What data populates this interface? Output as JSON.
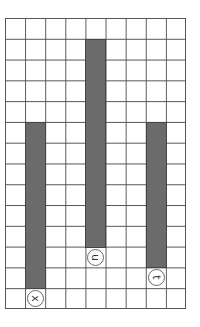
{
  "grid": {
    "columns": 9,
    "rows": 14,
    "line_color": "#555555"
  },
  "bar_color": "#6b6b6b",
  "bars": [
    {
      "column": 1,
      "top_row": 5,
      "bottom_row": 13,
      "label": "x"
    },
    {
      "column": 4,
      "top_row": 1,
      "bottom_row": 11,
      "label": "u"
    },
    {
      "column": 7,
      "top_row": 5,
      "bottom_row": 12,
      "label": "t"
    }
  ]
}
